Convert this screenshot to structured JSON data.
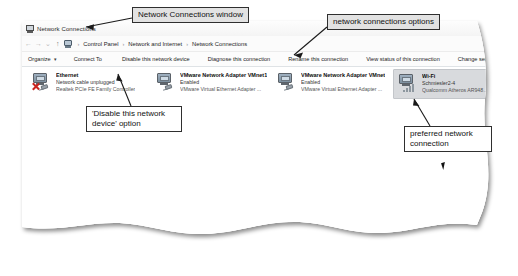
{
  "window": {
    "title": "Network Connections",
    "title_icon": "network-window-icon"
  },
  "navbar": {
    "back_icon": "←",
    "forward_icon": "→",
    "recent_icon": "⌄",
    "up_icon": "↑",
    "address_icon": "network-address-icon",
    "separator": "›",
    "breadcrumbs": [
      "Control Panel",
      "Network and Internet",
      "Network Connections"
    ]
  },
  "toolbar": {
    "organize_label": "Organize",
    "organize_caret": "▾",
    "commands": [
      "Connect To",
      "Disable this network device",
      "Diagnose this connection",
      "Rename this connection",
      "View status of this connection",
      "Change settings of this connection"
    ]
  },
  "connections": [
    {
      "name": "Ethernet",
      "status": "Network cable unplugged",
      "device": "Realtek PCIe FE Family Controller",
      "icon": "ethernet-adapter-icon",
      "badge": "red-x-disconnected-icon",
      "selected": false
    },
    {
      "name": "VMware Network Adapter VMnet1",
      "status": "Enabled",
      "device": "VMware Virtual Ethernet Adapter ...",
      "icon": "vmware-adapter-icon",
      "badge": "none",
      "selected": false
    },
    {
      "name": "VMware Network Adapter VMnet8",
      "status": "Enabled",
      "device": "VMware Virtual Ethernet Adapter ...",
      "icon": "vmware-adapter-icon",
      "badge": "none",
      "selected": false
    },
    {
      "name": "Wi-Fi",
      "status": "Schmiesler2-4",
      "device": "Qualcomm Atheros AR9485 Wirel...",
      "icon": "wifi-adapter-icon",
      "badge": "wifi-signal-bars-icon",
      "selected": true
    }
  ],
  "annotations": [
    {
      "id": "window",
      "text": "Network Connections window"
    },
    {
      "id": "options",
      "text": "network connections options"
    },
    {
      "id": "disable",
      "text": "'Disable this network device' option"
    },
    {
      "id": "preferred",
      "text": "preferred network connection"
    }
  ],
  "colors": {
    "callout_fill": "#e2e2e2",
    "callout_border": "#2f2f2f",
    "selection": "#d8dadd",
    "red_x": "#c9241f",
    "page_bg": "#ffffff"
  }
}
